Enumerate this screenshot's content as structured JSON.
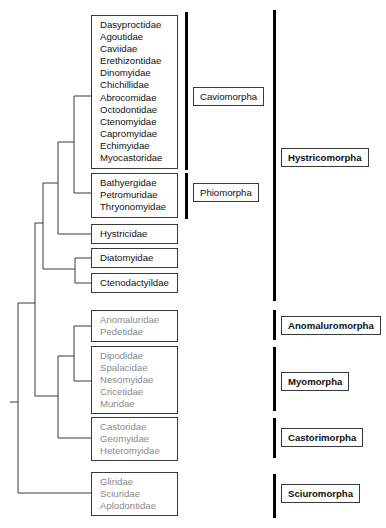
{
  "diagram": {
    "type": "phylogenetic-tree"
  },
  "families": {
    "caviomorpha": [
      "Dasyproctidae",
      "Agoutidae",
      "Caviidae",
      "Erethizontidae",
      "Dinomyidae",
      "Chichillidae",
      "Abrocomidae",
      "Octodontidae",
      "Ctenomyidae",
      "Capromyidae",
      "Echimyidae",
      "Myocastoridae"
    ],
    "phiomorpha": [
      "Bathyergidae",
      "Petromuridae",
      "Thryonomyidae"
    ],
    "hystricidae": [
      "Hystricidae"
    ],
    "diatomyidae": [
      "Diatomyidae"
    ],
    "ctenodactylidae": [
      "Ctenodactyildae"
    ],
    "anomaluromorpha": [
      "Anomaluridae",
      "Pedetidae"
    ],
    "myomorpha": [
      "Dipodidae",
      "Spalacidae",
      "Nesomyidae",
      "Cricetidae",
      "Muridae"
    ],
    "castorimorpha": [
      "Castoridae",
      "Geomyidae",
      "Heteromyidae"
    ],
    "sciuromorpha": [
      "Gliridae",
      "Sciuridae",
      "Aplodontidae"
    ]
  },
  "infraorders": {
    "caviomorpha": "Caviomorpha",
    "phiomorpha": "Phiomorpha"
  },
  "suborders": {
    "hystricomorpha": "Hystricomorpha",
    "anomaluromorpha": "Anomaluromorpha",
    "myomorpha": "Myomorpha",
    "castorimorpha": "Castorimorpha",
    "sciuromorpha": "Sciuromorpha"
  },
  "colors": {
    "line": "#3a3a3a",
    "bar": "#000000",
    "hystricomorph_text": "#111111",
    "other_text": "#8a8a8a"
  }
}
